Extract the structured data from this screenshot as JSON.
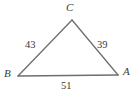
{
  "figure": {
    "kind": "triangle-diagram",
    "background_color": "#ffffff",
    "stroke_color": "#6e6e6e",
    "text_color": "#3a3a3a"
  },
  "vertices": [
    {
      "name": "C",
      "label": "C",
      "x": 72,
      "y": 20
    },
    {
      "name": "B",
      "label": "B",
      "x": 18,
      "y": 76
    },
    {
      "name": "A",
      "label": "A",
      "x": 118,
      "y": 75
    }
  ],
  "sides": [
    {
      "name": "BC",
      "label": "43",
      "value": 43
    },
    {
      "name": "CA",
      "label": "39",
      "value": 39
    },
    {
      "name": "AB",
      "label": "51",
      "value": 51
    }
  ]
}
